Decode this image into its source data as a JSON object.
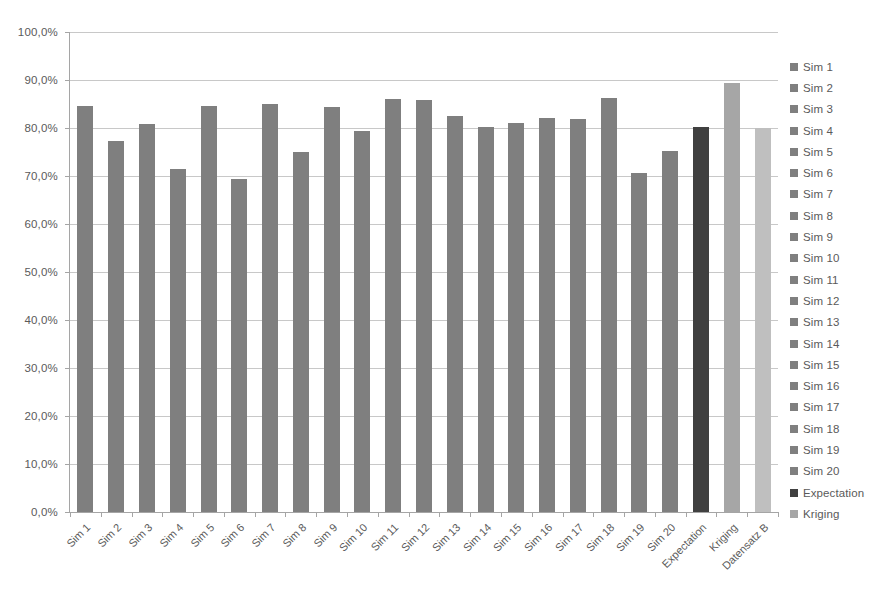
{
  "chart_data": {
    "type": "bar",
    "title": "",
    "subtitle": "",
    "xlabel": "",
    "ylabel": "",
    "ylim": [
      0,
      100
    ],
    "y_tick_step": 10,
    "grid": true,
    "legend_position": "right",
    "value_suffix": "%",
    "decimal_separator": ",",
    "categories": [
      "Sim 1",
      "Sim 2",
      "Sim 3",
      "Sim 4",
      "Sim 5",
      "Sim 6",
      "Sim 7",
      "Sim 8",
      "Sim 9",
      "Sim 10",
      "Sim 11",
      "Sim 12",
      "Sim 13",
      "Sim 14",
      "Sim 15",
      "Sim 16",
      "Sim 17",
      "Sim 18",
      "Sim 19",
      "Sim 20",
      "Expectation",
      "Kriging",
      "Datensatz B"
    ],
    "values": [
      84.5,
      77.2,
      80.8,
      71.4,
      84.5,
      69.3,
      85.0,
      74.9,
      84.3,
      79.4,
      86.0,
      85.9,
      82.6,
      80.3,
      81.0,
      82.1,
      81.8,
      86.3,
      70.6,
      75.3,
      80.2,
      89.4,
      79.9
    ],
    "bar_colors": [
      "#7f7f7f",
      "#7f7f7f",
      "#7f7f7f",
      "#7f7f7f",
      "#7f7f7f",
      "#7f7f7f",
      "#7f7f7f",
      "#7f7f7f",
      "#7f7f7f",
      "#7f7f7f",
      "#7f7f7f",
      "#7f7f7f",
      "#7f7f7f",
      "#7f7f7f",
      "#7f7f7f",
      "#7f7f7f",
      "#7f7f7f",
      "#7f7f7f",
      "#7f7f7f",
      "#7f7f7f",
      "#404040",
      "#a6a6a6",
      "#bfbfbf"
    ],
    "y_tick_labels": [
      "0,0%",
      "10,0%",
      "20,0%",
      "30,0%",
      "40,0%",
      "50,0%",
      "60,0%",
      "70,0%",
      "80,0%",
      "90,0%",
      "100,0%"
    ],
    "y_tick_values": [
      0,
      10,
      20,
      30,
      40,
      50,
      60,
      70,
      80,
      90,
      100
    ],
    "legend": [
      {
        "label": "Sim 1",
        "color": "#7f7f7f"
      },
      {
        "label": "Sim 2",
        "color": "#7f7f7f"
      },
      {
        "label": "Sim 3",
        "color": "#7f7f7f"
      },
      {
        "label": "Sim 4",
        "color": "#7f7f7f"
      },
      {
        "label": "Sim 5",
        "color": "#7f7f7f"
      },
      {
        "label": "Sim 6",
        "color": "#7f7f7f"
      },
      {
        "label": "Sim 7",
        "color": "#7f7f7f"
      },
      {
        "label": "Sim 8",
        "color": "#7f7f7f"
      },
      {
        "label": "Sim 9",
        "color": "#7f7f7f"
      },
      {
        "label": "Sim 10",
        "color": "#7f7f7f"
      },
      {
        "label": "Sim 11",
        "color": "#7f7f7f"
      },
      {
        "label": "Sim 12",
        "color": "#7f7f7f"
      },
      {
        "label": "Sim 13",
        "color": "#7f7f7f"
      },
      {
        "label": "Sim 14",
        "color": "#7f7f7f"
      },
      {
        "label": "Sim 15",
        "color": "#7f7f7f"
      },
      {
        "label": "Sim 16",
        "color": "#7f7f7f"
      },
      {
        "label": "Sim 17",
        "color": "#7f7f7f"
      },
      {
        "label": "Sim 18",
        "color": "#7f7f7f"
      },
      {
        "label": "Sim 19",
        "color": "#7f7f7f"
      },
      {
        "label": "Sim 20",
        "color": "#7f7f7f"
      },
      {
        "label": "Expectation",
        "color": "#404040"
      },
      {
        "label": "Kriging",
        "color": "#a6a6a6"
      }
    ],
    "style": {
      "gridline_color": "#c8c8c8",
      "axis_color": "#a5a5a5",
      "text_color": "#5a5a5a",
      "background": "#ffffff"
    }
  }
}
